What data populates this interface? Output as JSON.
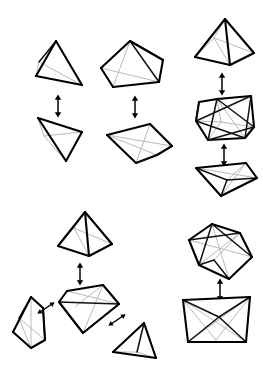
{
  "figure": {
    "background_color": "#ffffff",
    "width": 263,
    "height": 378,
    "stroke_colors": {
      "visible_edge": "#111111",
      "heavy_edge": "#000000",
      "hidden_edge": "#a8a8a8",
      "arrow": "#000000"
    },
    "groups": [
      {
        "id": "group-top-left",
        "label": "Tetrahedron pair",
        "shapes": [
          {
            "id": "tetrahedron-upright",
            "name": "tetrahedron",
            "position": "top",
            "vertex_count": 4,
            "edge_count": 6,
            "face_count": 4
          },
          {
            "id": "tetrahedron-inverted",
            "name": "tetrahedron",
            "position": "bottom",
            "vertex_count": 4,
            "edge_count": 6,
            "face_count": 4
          }
        ],
        "arrows": [
          {
            "id": "arrow-tl",
            "direction": "vertical-double",
            "connects": "tetrahedron-upright to tetrahedron-inverted"
          }
        ]
      },
      {
        "id": "group-top-middle",
        "label": "Pentagonal pyramid pair",
        "shapes": [
          {
            "id": "pentagonal-pyramid-upright",
            "name": "pentagonal pyramid",
            "position": "top",
            "vertex_count": 6,
            "edge_count": 10,
            "face_count": 6
          },
          {
            "id": "pentagonal-pyramid-flattened",
            "name": "pentagonal pyramid",
            "position": "bottom",
            "vertex_count": 6,
            "edge_count": 10,
            "face_count": 6
          }
        ],
        "arrows": [
          {
            "id": "arrow-tm",
            "direction": "vertical-double",
            "connects": "pentagonal-pyramid-upright to pentagonal-pyramid-flattened"
          }
        ]
      },
      {
        "id": "group-top-right",
        "label": "Square pyramid to cube to bipyramid chain",
        "shapes": [
          {
            "id": "square-pyramid",
            "name": "square pyramid",
            "position": "top",
            "vertex_count": 5,
            "edge_count": 8,
            "face_count": 5
          },
          {
            "id": "cube-with-inscribed-octahedron",
            "name": "cube with inscribed octahedron",
            "position": "middle",
            "vertex_count": 8,
            "edge_count": 12,
            "face_count": 6
          },
          {
            "id": "square-bipyramid",
            "name": "square bipyramid",
            "position": "bottom",
            "vertex_count": 6,
            "edge_count": 12,
            "face_count": 8
          }
        ],
        "arrows": [
          {
            "id": "arrow-tr-1",
            "direction": "vertical-double",
            "connects": "square-pyramid to cube-with-inscribed-octahedron"
          },
          {
            "id": "arrow-tr-2",
            "direction": "vertical-double",
            "connects": "cube-with-inscribed-octahedron to square-bipyramid"
          }
        ]
      },
      {
        "id": "group-bottom-left",
        "label": "Square pyramid branching to three solids",
        "shapes": [
          {
            "id": "square-pyramid-2",
            "name": "square pyramid",
            "position": "top",
            "vertex_count": 5,
            "edge_count": 8,
            "face_count": 5
          },
          {
            "id": "open-wedge-center",
            "name": "tilted square pyramid",
            "position": "center",
            "vertex_count": 5,
            "edge_count": 8,
            "face_count": 5
          },
          {
            "id": "oblique-wedge-left",
            "name": "oblique wedge",
            "position": "left",
            "vertex_count": 6,
            "edge_count": 9,
            "face_count": 5
          },
          {
            "id": "tetrahedron-right",
            "name": "tetrahedron",
            "position": "right",
            "vertex_count": 4,
            "edge_count": 6,
            "face_count": 4
          }
        ],
        "arrows": [
          {
            "id": "arrow-bl-1",
            "direction": "vertical-double",
            "connects": "square-pyramid-2 to open-wedge-center"
          },
          {
            "id": "arrow-bl-2",
            "direction": "diagonal-double-left",
            "connects": "open-wedge-center to oblique-wedge-left"
          },
          {
            "id": "arrow-bl-3",
            "direction": "diagonal-double-right",
            "connects": "open-wedge-center to tetrahedron-right"
          }
        ]
      },
      {
        "id": "group-bottom-right",
        "label": "Octahedron to open bipyramid",
        "shapes": [
          {
            "id": "octahedron-tilted",
            "name": "octahedron",
            "position": "top",
            "vertex_count": 6,
            "edge_count": 12,
            "face_count": 8
          },
          {
            "id": "open-bipyramid",
            "name": "open square antiprism",
            "position": "bottom",
            "vertex_count": 6,
            "edge_count": 11,
            "face_count": 6
          }
        ],
        "arrows": [
          {
            "id": "arrow-br",
            "direction": "vertical-double",
            "connects": "octahedron-tilted to open-bipyramid"
          }
        ]
      }
    ]
  }
}
